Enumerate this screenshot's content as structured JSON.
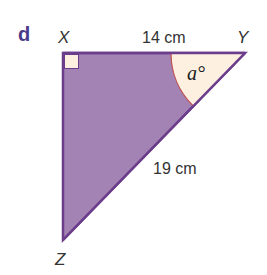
{
  "question_label": "d",
  "vertices": {
    "X": "X",
    "Y": "Y",
    "Z": "Z"
  },
  "sides": {
    "XY": "14 cm",
    "YZ": "19 cm"
  },
  "angle_label": "a°",
  "colors": {
    "fill": "#a383b4",
    "stroke": "#6b3d8a",
    "angle_fill": "#fdf0e0",
    "angle_arc": "#c0504d",
    "question_label": "#4a3a8a"
  }
}
